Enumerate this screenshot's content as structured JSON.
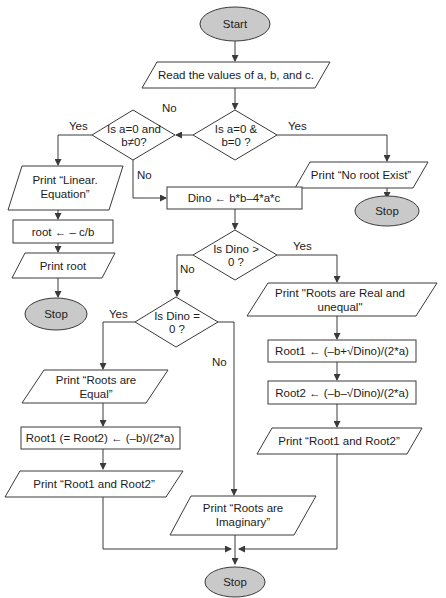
{
  "diagram": {
    "type": "flowchart",
    "colors": {
      "terminal_fill": "#c9c9c9",
      "stroke": "#3a3a3a",
      "text": "#1c1c1c",
      "background": "#ffffff"
    },
    "nodes": {
      "start": {
        "shape": "oval",
        "text": "Start"
      },
      "read_input": {
        "shape": "parallelogram",
        "text": "Read the values of a, b, and c."
      },
      "check_a0_b0": {
        "shape": "diamond",
        "line1": "Is a=0 &",
        "line2": "b=0 ?"
      },
      "print_no_root": {
        "shape": "parallelogram",
        "text": "Print “No root Exist”"
      },
      "stop_no_root": {
        "shape": "oval",
        "text": "Stop"
      },
      "check_linear": {
        "shape": "diamond",
        "line1": "Is a=0 and",
        "line2": "b≠0?"
      },
      "print_linear": {
        "shape": "parallelogram",
        "line1": "Print “Linear.",
        "line2": "Equation”"
      },
      "compute_root": {
        "shape": "rectangle",
        "text": "root ←  – c/b"
      },
      "print_root": {
        "shape": "parallelogram",
        "text": "Print root"
      },
      "stop_linear": {
        "shape": "oval",
        "text": "Stop"
      },
      "compute_dino": {
        "shape": "rectangle",
        "text": "Dino ← b*b–4*a*c"
      },
      "check_dino_gt0": {
        "shape": "diamond",
        "line1": "Is Dino >",
        "line2": "0 ?"
      },
      "print_real_unequal": {
        "shape": "parallelogram",
        "line1": "Print \"Roots are Real and",
        "line2": "unequal\""
      },
      "compute_root1": {
        "shape": "rectangle",
        "text": "Root1 ←  (–b+√Dino)/(2*a)"
      },
      "compute_root2": {
        "shape": "rectangle",
        "text": "Root2 ←  (–b–√Dino)/(2*a)"
      },
      "print_roots_right": {
        "shape": "parallelogram",
        "text": "Print “Root1 and Root2”"
      },
      "check_dino_eq0": {
        "shape": "diamond",
        "line1": "Is Dino =",
        "line2": "0 ?"
      },
      "print_equal": {
        "shape": "parallelogram",
        "line1": "Print “Roots are",
        "line2": "Equal”"
      },
      "compute_equal_root": {
        "shape": "rectangle",
        "text": "Root1 (= Root2) ←  (–b)/(2*a)"
      },
      "print_roots_left": {
        "shape": "parallelogram",
        "text": "Print “Root1 and Root2”"
      },
      "print_imaginary": {
        "shape": "parallelogram",
        "line1": "Print “Roots are",
        "line2": "Imaginary”"
      },
      "stop_final": {
        "shape": "oval",
        "text": "Stop"
      }
    },
    "edge_labels": {
      "a0b0_yes": "Yes",
      "a0b0_no": "No",
      "linear_yes": "Yes",
      "linear_no": "No",
      "dino_gt0_yes": "Yes",
      "dino_gt0_no": "No",
      "dino_eq0_yes": "Yes",
      "dino_eq0_no": "No"
    }
  }
}
